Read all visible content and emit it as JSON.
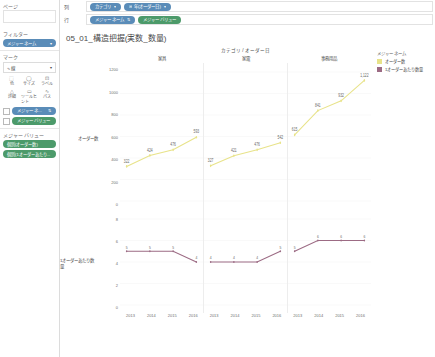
{
  "shelves": {
    "pages_label": "ページ",
    "filters_label": "フィルター",
    "marks_label": "マーク",
    "columns_label": "列",
    "rows_label": "行",
    "columns_pills": [
      {
        "text": "カテゴリ",
        "color": "blue",
        "caret": "▾"
      },
      {
        "text": "年(オーダー日)",
        "color": "blue",
        "caret": "▾",
        "lead": "⊞"
      }
    ],
    "rows_pills": [
      {
        "text": "メジャー ネーム",
        "color": "blue",
        "caret": "⇅"
      },
      {
        "text": "メジャー バリュー",
        "color": "green",
        "caret": ""
      }
    ],
    "filter_pill": {
      "text": "メジャー ネーム",
      "caret": "▾"
    }
  },
  "marks": {
    "type_value": "∿ 線",
    "type_caret": "▾",
    "buttons": [
      {
        "glyph": "⬚",
        "label": "色"
      },
      {
        "glyph": "◯",
        "label": "サイズ"
      },
      {
        "glyph": "⊡",
        "label": "ラベル"
      },
      {
        "glyph": "△",
        "label": "詳細"
      },
      {
        "glyph": "▭",
        "label": "ツールヒント"
      },
      {
        "glyph": "∿",
        "label": "パス"
      }
    ],
    "pills": [
      {
        "text": "メジャー ネ...",
        "color": "blue",
        "caret": "⇅",
        "icon": "⇅"
      },
      {
        "text": "メジャー バリュー",
        "color": "green",
        "caret": "",
        "icon": "⊞"
      }
    ]
  },
  "measure_values": {
    "title": "メジャー バリュー",
    "items": [
      "個別(オーダー数)",
      "個別(1オーダーあたり..."
    ]
  },
  "viz": {
    "title": "05_01_構造把握(実数_数量)",
    "column_header": "カテゴリ / オーダー日",
    "panes": [
      "家具",
      "家電",
      "事務用品"
    ],
    "row_titles": [
      "オーダー数",
      "1オーダーあたり数量"
    ]
  },
  "legend": {
    "title": "メジャー ネーム",
    "items": [
      {
        "label": "オーダー数",
        "color": "#e8e38a"
      },
      {
        "label": "1オーダーあたり数量",
        "color": "#9c6b84"
      }
    ]
  },
  "chart_data": {
    "type": "line",
    "title": "05_01_構造把握(実数_数量)",
    "xlabel": "カテゴリ / オーダー日",
    "x": [
      "2013",
      "2014",
      "2015",
      "2016"
    ],
    "panels": [
      {
        "name": "家具",
        "rows": [
          {
            "name": "オーダー数",
            "color": "#e8e38a",
            "values": [
              322,
              424,
              476,
              593
            ],
            "ylim": [
              0,
              1200
            ],
            "yticks": [
              0,
              200,
              400,
              600,
              800,
              1000,
              1200
            ]
          },
          {
            "name": "1オーダーあたり数量",
            "color": "#9c6b84",
            "values": [
              5,
              5,
              5,
              4
            ],
            "ylim": [
              0,
              8
            ],
            "yticks": [
              0,
              2,
              4,
              6,
              8
            ]
          }
        ]
      },
      {
        "name": "家電",
        "rows": [
          {
            "name": "オーダー数",
            "color": "#e8e38a",
            "values": [
              327,
              421,
              476,
              542
            ],
            "ylim": [
              0,
              1200
            ],
            "yticks": [
              0,
              200,
              400,
              600,
              800,
              1000,
              1200
            ]
          },
          {
            "name": "1オーダーあたり数量",
            "color": "#9c6b84",
            "values": [
              4,
              4,
              4,
              5
            ],
            "ylim": [
              0,
              8
            ],
            "yticks": [
              0,
              2,
              4,
              6,
              8
            ]
          }
        ]
      },
      {
        "name": "事務用品",
        "rows": [
          {
            "name": "オーダー数",
            "color": "#e8e38a",
            "values": [
              615,
              841,
              932,
              1122
            ],
            "ylim": [
              0,
              1200
            ],
            "yticks": [
              0,
              200,
              400,
              600,
              800,
              1000,
              1200
            ],
            "point_labels": [
              "615",
              "841",
              "932",
              "1,122"
            ]
          },
          {
            "name": "1オーダーあたり数量",
            "color": "#9c6b84",
            "values": [
              5,
              6,
              6,
              6
            ],
            "ylim": [
              0,
              8
            ],
            "yticks": [
              0,
              2,
              4,
              6,
              8
            ]
          }
        ]
      }
    ],
    "yticks_top": [
      "1200",
      "1000",
      "800",
      "600",
      "400",
      "200",
      "0"
    ],
    "yticks_bottom": [
      "8",
      "6",
      "4",
      "2",
      "0"
    ]
  }
}
